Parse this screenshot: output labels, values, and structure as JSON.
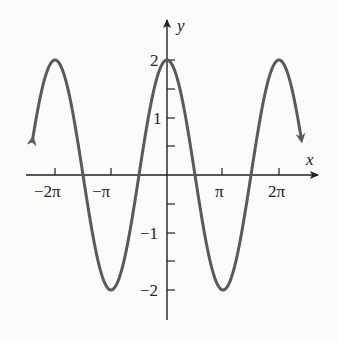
{
  "chart_data": {
    "type": "line",
    "title": "",
    "function": "y = 2cos(x)",
    "xlabel": "x",
    "ylabel": "y",
    "x_tick_labels": [
      "-2π",
      "-π",
      "π",
      "2π"
    ],
    "x_tick_values": [
      -6.2832,
      -3.1416,
      3.1416,
      6.2832
    ],
    "y_tick_labels": [
      "2",
      "1",
      "-1",
      "-2"
    ],
    "y_tick_values": [
      2,
      1,
      -1,
      -2
    ],
    "y_minor_ticks": [
      1.5,
      0.5,
      -0.5,
      -1.5
    ],
    "xlim": [
      -2.4,
      2.4
    ],
    "xlim_units": "multiples of π",
    "ylim": [
      -2.5,
      2.7
    ],
    "grid": false,
    "legend": null,
    "series": [
      {
        "name": "2cos(x)",
        "x": [
          "-2.4π",
          "-2π",
          "-1.5π",
          "-π",
          "-0.5π",
          "0",
          "0.5π",
          "π",
          "1.5π",
          "2π",
          "2.4π"
        ],
        "values": [
          0.62,
          2,
          0,
          -2,
          0,
          2,
          0,
          -2,
          0,
          2,
          0.62
        ],
        "color": "#5a5a5a",
        "end_arrows": true
      }
    ]
  },
  "labels": {
    "x_axis": "x",
    "y_axis": "y",
    "x_ticks": [
      "−2π",
      "−π",
      "π",
      "2π"
    ],
    "y_ticks": [
      "2",
      "1",
      "−1",
      "−2"
    ]
  }
}
